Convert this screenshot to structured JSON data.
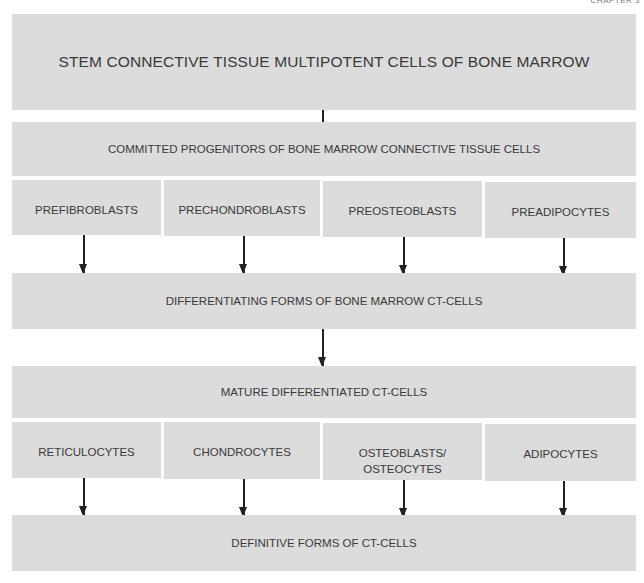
{
  "page": {
    "chapter_label": "CHAPTER 3"
  },
  "diagram": {
    "stem": "STEM CONNECTIVE TISSUE MULTIPOTENT CELLS OF BONE MARROW",
    "committed": "COMMITTED PROGENITORS OF BONE MARROW CONNECTIVE TISSUE CELLS",
    "progenitors": [
      "PREFIBROBLASTS",
      "PRECHONDROBLASTS",
      "PREOSTEOBLASTS",
      "PREADIPOCYTES"
    ],
    "differentiating": "DIFFERENTIATING FORMS OF BONE MARROW CT-CELLS",
    "mature": "MATURE DIFFERENTIATED CT-CELLS",
    "mature_cells": [
      "RETICULOCYTES",
      "CHONDROCYTES",
      "OSTEOBLASTS/ OSTEOCYTES",
      "ADIPOCYTES"
    ],
    "definitive": "DEFINITIVE FORMS OF CT-CELLS"
  },
  "colors": {
    "box_fill": "#dcdcdc",
    "text": "#3a3a3a",
    "arrow": "#222222"
  }
}
